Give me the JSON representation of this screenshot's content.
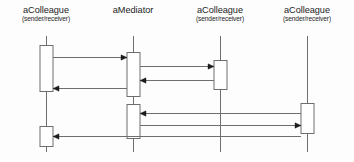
{
  "diagram": {
    "type": "uml-sequence-diagram",
    "background_color": "#fdfdfd",
    "line_color": "#6e6e6e",
    "box_fill_color": "#ffffff",
    "text_color": "#1c1c1c",
    "width": 354,
    "height": 162,
    "lifelines": [
      {
        "id": "colleague-1",
        "name": "aColleague",
        "role": "(sender/receiver)",
        "x": 46,
        "label_top": 6,
        "line_top": 36,
        "line_bottom": 152,
        "activations": [
          {
            "id": "act-c1-a",
            "top": 45,
            "bottom": 91,
            "width": 13
          },
          {
            "id": "act-c1-b",
            "top": 126,
            "bottom": 146,
            "width": 13
          }
        ]
      },
      {
        "id": "mediator",
        "name": "aMediator",
        "role": "",
        "x": 133,
        "label_top": 6,
        "line_top": 36,
        "line_bottom": 152,
        "activations": [
          {
            "id": "act-m-a",
            "top": 52,
            "bottom": 96,
            "width": 13
          },
          {
            "id": "act-m-b",
            "top": 104,
            "bottom": 138,
            "width": 13
          }
        ]
      },
      {
        "id": "colleague-2",
        "name": "aColleague",
        "role": "(sender/receiver)",
        "x": 220,
        "label_top": 6,
        "line_top": 36,
        "line_bottom": 152,
        "activations": [
          {
            "id": "act-c2-a",
            "top": 60,
            "bottom": 89,
            "width": 13
          }
        ]
      },
      {
        "id": "colleague-3",
        "name": "aColleague",
        "role": "(sender/receiver)",
        "x": 307,
        "label_top": 6,
        "line_top": 36,
        "line_bottom": 152,
        "activations": [
          {
            "id": "act-c3-a",
            "top": 103,
            "bottom": 133,
            "width": 13
          }
        ]
      }
    ],
    "messages": [
      {
        "id": "msg-1",
        "from_x": 53,
        "to_x": 127,
        "y": 57,
        "direction": "right",
        "label": ""
      },
      {
        "id": "msg-2",
        "from_x": 140,
        "to_x": 214,
        "y": 66,
        "direction": "right",
        "label": ""
      },
      {
        "id": "msg-3",
        "from_x": 214,
        "to_x": 140,
        "y": 80,
        "direction": "left",
        "label": ""
      },
      {
        "id": "msg-4",
        "from_x": 127,
        "to_x": 53,
        "y": 88,
        "direction": "left",
        "label": ""
      },
      {
        "id": "msg-5",
        "from_x": 301,
        "to_x": 140,
        "y": 113,
        "direction": "left",
        "label": ""
      },
      {
        "id": "msg-6",
        "from_x": 140,
        "to_x": 301,
        "y": 125,
        "direction": "right",
        "label": ""
      },
      {
        "id": "msg-7",
        "from_x": 301,
        "to_x": 53,
        "y": 136,
        "direction": "left",
        "label": ""
      }
    ]
  }
}
